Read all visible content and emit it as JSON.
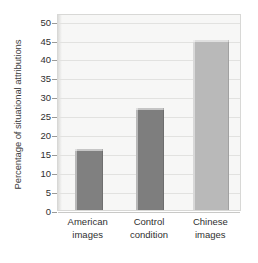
{
  "chart_data": {
    "type": "bar",
    "title": "",
    "xlabel": "",
    "ylabel": "Percentage of situational attributions",
    "categories": [
      "American images",
      "Control condition",
      "Chinese images"
    ],
    "category_lines": [
      [
        "American",
        "images"
      ],
      [
        "Control",
        "condition"
      ],
      [
        "Chinese",
        "images"
      ]
    ],
    "values": [
      16,
      27,
      45
    ],
    "ylim": [
      0,
      52
    ],
    "yticks": [
      0,
      5,
      10,
      15,
      20,
      25,
      30,
      35,
      40,
      45,
      50
    ],
    "ytick_labels": [
      "0",
      "5",
      "10",
      "15",
      "20",
      "25",
      "30",
      "35",
      "40",
      "45",
      "50"
    ],
    "grid": "horizontal",
    "legend": "none",
    "bar_colors": [
      "#808080",
      "#7e7e7e",
      "#b9b9b9"
    ],
    "plot_background": "#f7f7f6",
    "gridline_color": "#e2e2e0",
    "axis_color": "#9a9a98",
    "text_color": "#2f2f2f"
  }
}
